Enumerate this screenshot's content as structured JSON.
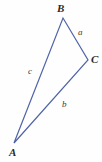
{
  "figure": {
    "kind": "triangle-diagram",
    "width": 102,
    "height": 162,
    "background_color": "#fefefe",
    "stroke_color": "#4f63a8",
    "stroke_width": 1.2,
    "label_color": "#2b2b2b",
    "side_label_color": "#3a3a3a"
  },
  "vertices": [
    {
      "name": "A",
      "label": "A",
      "x": 14,
      "y": 143
    },
    {
      "name": "B",
      "label": "B",
      "x": 63,
      "y": 18
    },
    {
      "name": "C",
      "label": "C",
      "x": 88,
      "y": 60
    }
  ],
  "sides": [
    {
      "name": "a",
      "label": "a",
      "from": "B",
      "to": "C"
    },
    {
      "name": "b",
      "label": "b",
      "from": "C",
      "to": "A"
    },
    {
      "name": "c",
      "label": "c",
      "from": "A",
      "to": "B"
    }
  ],
  "chart_data": {
    "type": "diagram",
    "title": "",
    "shape": "triangle",
    "points": {
      "A": [
        14,
        143
      ],
      "B": [
        63,
        18
      ],
      "C": [
        88,
        60
      ]
    },
    "edges": [
      {
        "label": "a",
        "endpoints": [
          "B",
          "C"
        ],
        "label_position": [
          80,
          33
        ]
      },
      {
        "label": "b",
        "endpoints": [
          "C",
          "A"
        ],
        "label_position": [
          64,
          104
        ]
      },
      {
        "label": "c",
        "endpoints": [
          "A",
          "B"
        ],
        "label_position": [
          31,
          71
        ]
      }
    ],
    "vertex_labels": [
      "A",
      "B",
      "C"
    ],
    "edge_labels": [
      "a",
      "b",
      "c"
    ],
    "annotations": [],
    "grid": false,
    "legend": null
  }
}
